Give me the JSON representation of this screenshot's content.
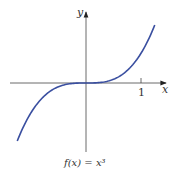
{
  "chart_data": {
    "type": "line",
    "title": "",
    "caption": "f(x) = x³",
    "xlabel": "x",
    "ylabel": "y",
    "x_ticks": [
      1
    ],
    "x_tick_labels": [
      "1"
    ],
    "xlim": [
      -1.25,
      1.25
    ],
    "ylim": [
      -2,
      2
    ],
    "grid": false,
    "series": [
      {
        "name": "f(x) = x^3",
        "color": "#3a4fa0",
        "x": [
          -1.25,
          -1.0,
          -0.75,
          -0.5,
          -0.25,
          0,
          0.25,
          0.5,
          0.75,
          1.0,
          1.25
        ],
        "y": [
          -1.953,
          -1.0,
          -0.422,
          -0.125,
          -0.016,
          0,
          0.016,
          0.125,
          0.422,
          1.0,
          1.953
        ]
      }
    ]
  },
  "labels": {
    "x_axis": "x",
    "y_axis": "y",
    "tick_1": "1",
    "caption": "f(x) = x³"
  }
}
